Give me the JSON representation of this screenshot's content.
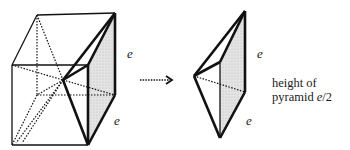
{
  "diagram": {
    "left_figure": {
      "description": "Cube with dotted diagonals to center, one pyramid highlighted",
      "edge_labels": [
        "e",
        "e"
      ]
    },
    "arrow": {
      "style": "dotted",
      "direction": "right"
    },
    "right_figure": {
      "description": "Extracted square pyramid",
      "edge_labels": [
        "e",
        "e"
      ]
    },
    "caption": {
      "line1": "height of",
      "line2_prefix": "pyramid ",
      "line2_var": "e",
      "line2_suffix": "/2"
    },
    "colors": {
      "stroke": "#111111",
      "shade": "#d9d9d9"
    }
  }
}
